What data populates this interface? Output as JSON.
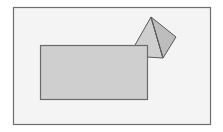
{
  "diagram": {
    "type": "geometry",
    "colors": {
      "background": "#ffffff",
      "frame_fill": "#f4f4f4",
      "frame_stroke": "#6e6e6e",
      "rect_fill": "#cfcfcf",
      "rect_stroke": "#6a6a6a",
      "pyramid_left_face": "#cfcfcf",
      "pyramid_right_face": "#bdbdbd",
      "pyramid_stroke": "#5a5a5a"
    },
    "frame": {
      "x": 13,
      "y": 7,
      "width": 197,
      "height": 117
    },
    "rectangle": {
      "x": 40,
      "y": 45,
      "width": 107,
      "height": 54
    },
    "pyramid": {
      "apex": [
        151,
        17
      ],
      "right": [
        176,
        37
      ],
      "bottom": [
        163,
        58
      ],
      "left_base": [
        135,
        45
      ],
      "hidden_corner": [
        147,
        57
      ]
    }
  }
}
